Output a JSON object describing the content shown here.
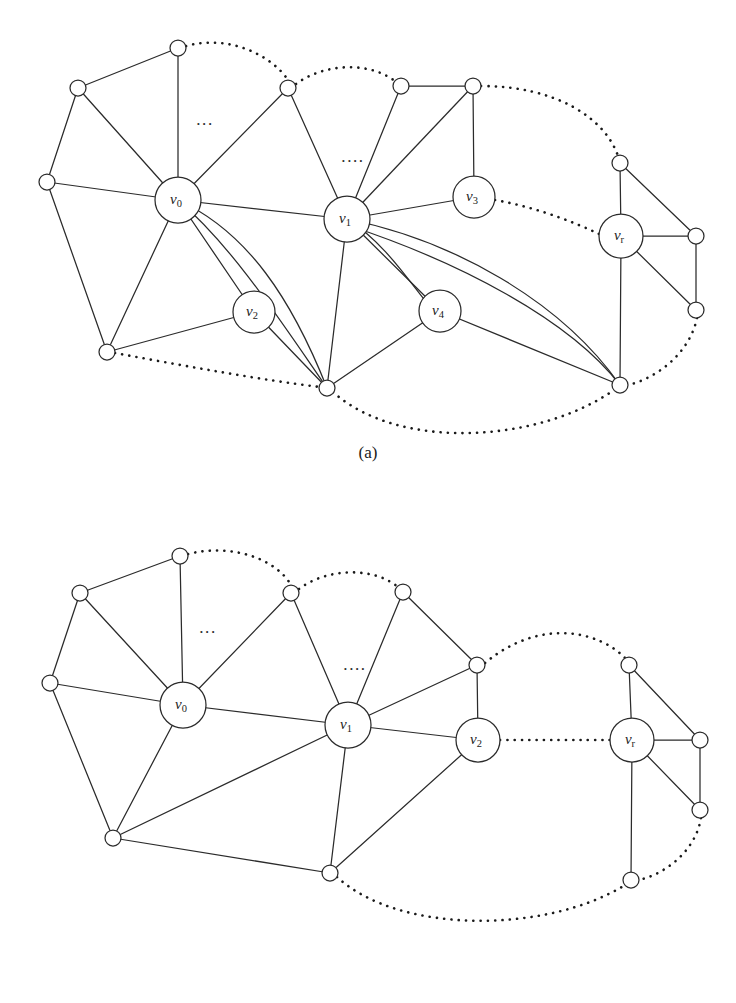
{
  "document": {
    "type": "figure-pair-graph-diagram",
    "background_color": "#ffffff",
    "ink_color": "#2b2b2b"
  },
  "figures": [
    {
      "id": "figure-a",
      "caption": "(a)",
      "labeled_nodes": [
        {
          "name": "v0",
          "base": "v",
          "sub": "0",
          "x": 178,
          "y": 200,
          "r": 23
        },
        {
          "name": "v1",
          "base": "v",
          "sub": "1",
          "x": 347,
          "y": 219,
          "r": 23
        },
        {
          "name": "v2",
          "base": "v",
          "sub": "2",
          "x": 254,
          "y": 312,
          "r": 21
        },
        {
          "name": "v3",
          "base": "v",
          "sub": "3",
          "x": 474,
          "y": 197,
          "r": 21
        },
        {
          "name": "v4",
          "base": "v",
          "sub": "4",
          "x": 440,
          "y": 311,
          "r": 21
        },
        {
          "name": "vr",
          "base": "v",
          "sub": "r",
          "x": 621,
          "y": 236,
          "r": 22
        }
      ],
      "plain_nodes": [
        {
          "id": "a-t0",
          "x": 178,
          "y": 48,
          "r": 8
        },
        {
          "id": "a-l1",
          "x": 78,
          "y": 88,
          "r": 8
        },
        {
          "id": "a-l2",
          "x": 47,
          "y": 182,
          "r": 8
        },
        {
          "id": "a-bl",
          "x": 107,
          "y": 352,
          "r": 8
        },
        {
          "id": "a-t1",
          "x": 288,
          "y": 88,
          "r": 8
        },
        {
          "id": "a-t2",
          "x": 401,
          "y": 86,
          "r": 8
        },
        {
          "id": "a-t3",
          "x": 473,
          "y": 86,
          "r": 8
        },
        {
          "id": "a-bm",
          "x": 327,
          "y": 388,
          "r": 8
        },
        {
          "id": "a-rt",
          "x": 620,
          "y": 163,
          "r": 8
        },
        {
          "id": "a-rr",
          "x": 696,
          "y": 236,
          "r": 8
        },
        {
          "id": "a-rb",
          "x": 696,
          "y": 310,
          "r": 8
        },
        {
          "id": "a-br",
          "x": 620,
          "y": 385,
          "r": 8
        }
      ],
      "ellipsis_marks": [
        {
          "x": 205,
          "y": 125,
          "text": "..."
        },
        {
          "x": 353,
          "y": 162,
          "text": "...."
        }
      ]
    },
    {
      "id": "figure-b",
      "caption": "(b)",
      "labeled_nodes": [
        {
          "name": "v0",
          "base": "v",
          "sub": "0",
          "x": 183,
          "y": 200,
          "r": 23
        },
        {
          "name": "v1",
          "base": "v",
          "sub": "1",
          "x": 348,
          "y": 220,
          "r": 23
        },
        {
          "name": "v2",
          "base": "v",
          "sub": "2",
          "x": 478,
          "y": 235,
          "r": 22
        },
        {
          "name": "vr",
          "base": "v",
          "sub": "r",
          "x": 632,
          "y": 235,
          "r": 22
        }
      ],
      "plain_nodes": [
        {
          "id": "b-t0",
          "x": 180,
          "y": 51,
          "r": 8
        },
        {
          "id": "b-l1",
          "x": 80,
          "y": 88,
          "r": 8
        },
        {
          "id": "b-l2",
          "x": 50,
          "y": 178,
          "r": 8
        },
        {
          "id": "b-bl",
          "x": 113,
          "y": 333,
          "r": 8
        },
        {
          "id": "b-t1",
          "x": 291,
          "y": 88,
          "r": 8
        },
        {
          "id": "b-t2",
          "x": 403,
          "y": 87,
          "r": 8
        },
        {
          "id": "b-t3",
          "x": 477,
          "y": 160,
          "r": 8
        },
        {
          "id": "b-bm",
          "x": 330,
          "y": 368,
          "r": 8
        },
        {
          "id": "b-rt",
          "x": 629,
          "y": 160,
          "r": 8
        },
        {
          "id": "b-rr",
          "x": 700,
          "y": 235,
          "r": 8
        },
        {
          "id": "b-rb",
          "x": 700,
          "y": 305,
          "r": 8
        },
        {
          "id": "b-br",
          "x": 631,
          "y": 375,
          "r": 8
        }
      ],
      "ellipsis_marks": [
        {
          "x": 208,
          "y": 128,
          "text": "..."
        },
        {
          "x": 355,
          "y": 165,
          "text": "...."
        }
      ]
    }
  ]
}
